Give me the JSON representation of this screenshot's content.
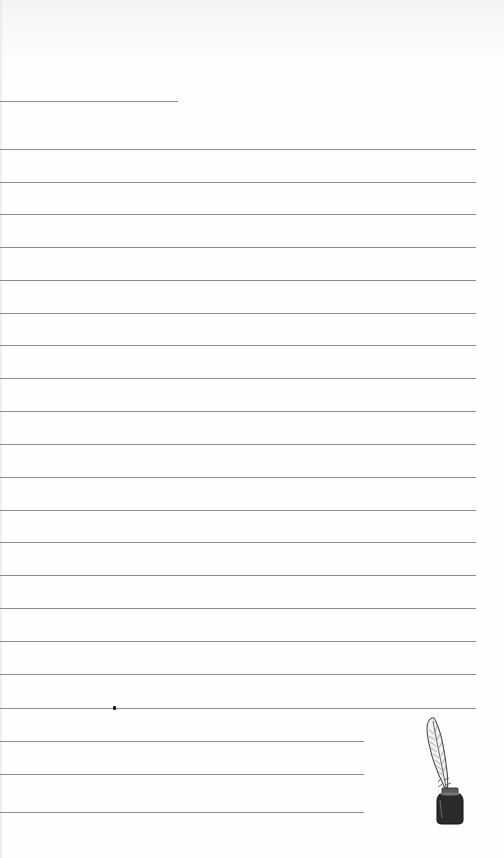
{
  "page": {
    "type": "lined notepaper",
    "line_color": "#8c8c8c",
    "background_color": "#fefefe"
  },
  "header_line": {
    "y": 101,
    "x_end": 178
  },
  "full_lines": {
    "x_end": 476,
    "y": [
      149,
      182,
      214,
      247,
      280,
      313,
      345,
      378,
      411,
      444,
      477,
      510,
      542,
      575,
      608,
      641,
      674,
      708
    ]
  },
  "short_lines": {
    "x_end": 364,
    "y": [
      741,
      774,
      812
    ]
  },
  "marks": [
    {
      "x": 113,
      "y": 706
    }
  ],
  "decoration": {
    "icon": "quill-and-inkwell-icon"
  }
}
